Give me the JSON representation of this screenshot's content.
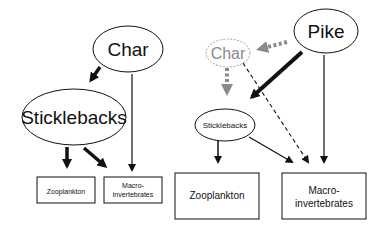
{
  "left_panel": {
    "nodes": {
      "char": "Char",
      "sticklebacks": "Sticklebacks",
      "zooplankton": "Zooplankton",
      "macro_line1": "Macro-",
      "macro_line2": "invertebrates"
    },
    "edges": [
      {
        "from": "Char",
        "to": "Sticklebacks",
        "style": "thick"
      },
      {
        "from": "Char",
        "to": "Macroinvertebrates",
        "style": "thin"
      },
      {
        "from": "Sticklebacks",
        "to": "Zooplankton",
        "style": "thick"
      },
      {
        "from": "Sticklebacks",
        "to": "Macroinvertebrates",
        "style": "thick"
      }
    ]
  },
  "right_panel": {
    "nodes": {
      "pike": "Pike",
      "char": "Char",
      "sticklebacks": "Sticklebacks",
      "zooplankton": "Zooplankton",
      "macro_line1": "Macro-",
      "macro_line2": "invertebrates"
    },
    "edges": [
      {
        "from": "Pike",
        "to": "Char",
        "style": "gray-dotted-thick"
      },
      {
        "from": "Char",
        "to": "Sticklebacks",
        "style": "gray-dotted-thick"
      },
      {
        "from": "Char",
        "to": "Macroinvertebrates",
        "style": "dashed"
      },
      {
        "from": "Pike",
        "to": "Sticklebacks",
        "style": "very-thick"
      },
      {
        "from": "Pike",
        "to": "Macroinvertebrates",
        "style": "thin"
      },
      {
        "from": "Sticklebacks",
        "to": "Zooplankton",
        "style": "thin"
      },
      {
        "from": "Sticklebacks",
        "to": "Macroinvertebrates",
        "style": "thin"
      }
    ]
  },
  "colors": {
    "ink": "#111111",
    "ghost": "#8a8a8a"
  }
}
